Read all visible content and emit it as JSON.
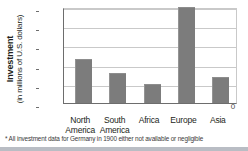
{
  "chart_data": {
    "type": "bar",
    "title": "",
    "xlabel": "",
    "ylabel": "Investment (in millions of U.S. dollars)",
    "ylabel_line1": "Investment",
    "ylabel_line2": "(in millions of U.S. dollars)",
    "categories": [
      "North America",
      "South America",
      "Africa",
      "Europe",
      "Asia"
    ],
    "category_lines": [
      [
        "North",
        "America"
      ],
      [
        "South",
        "America"
      ],
      [
        "Africa"
      ],
      [
        "Europe"
      ],
      [
        "Asia"
      ]
    ],
    "values": [
      1150,
      790,
      500,
      2490,
      680
    ],
    "ylim": [
      0,
      2500
    ],
    "yticks": [
      0,
      500,
      1000,
      1500,
      2000,
      2500
    ],
    "ytick_labels": [
      "0",
      "500",
      "1,000",
      "1,500",
      "2,000",
      "2,500"
    ],
    "grid": true,
    "legend": "none",
    "bar_color": "#7c7c7c",
    "grid_color": "#c9c9c9",
    "axis_color": "#6d6d6d",
    "background": "#ffffff"
  },
  "footnote": {
    "text": "* All investment data for Germany in 1900 either not available or negligible"
  }
}
